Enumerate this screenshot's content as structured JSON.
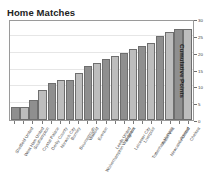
{
  "chart": {
    "title": "Home Matches",
    "ylabel": "Cumulative Points"
  },
  "chart_data": {
    "type": "bar",
    "title": "Home Matches",
    "xlabel": "",
    "ylabel": "Cumulative Points",
    "ylim": [
      0,
      30
    ],
    "yticks": [
      0,
      5,
      10,
      15,
      20,
      25,
      30
    ],
    "grid": true,
    "legend": "none",
    "yaxis_position": "right",
    "xtick_rotation": -58,
    "categories": [
      "Sheffield United",
      "West Ham United",
      "Southampton",
      "Crystal Palace",
      "Derby County",
      "Norwich City",
      "Burnley",
      "Bournemouth",
      "Watford",
      "Everton",
      "Wolverhampton Wanderers",
      "Leeds United",
      "Brighton",
      "Leicester City",
      "Liverpool",
      "Tottenham Hotspur",
      "Aston Villa",
      "Newcastle United",
      "Arsenal",
      "Chelsea"
    ],
    "values": [
      4,
      4,
      6,
      9,
      11,
      12,
      12,
      14,
      16,
      17,
      18,
      19,
      20,
      21,
      22,
      23,
      25,
      26,
      27,
      27
    ],
    "bar_colors": [
      "#8f8f8f",
      "#bdbdbd"
    ]
  }
}
